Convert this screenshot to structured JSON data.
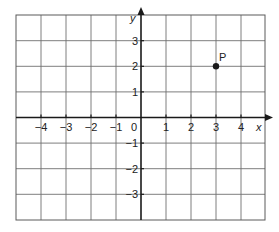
{
  "chart_data": {
    "type": "scatter",
    "title": "",
    "xlabel": "x",
    "ylabel": "y",
    "xlim": [
      -5,
      5
    ],
    "ylim": [
      -4,
      4
    ],
    "grid": true,
    "x_ticks": [
      -4,
      -3,
      -2,
      -1,
      1,
      2,
      3,
      4
    ],
    "y_ticks": [
      -3,
      -2,
      -1,
      1,
      2,
      3
    ],
    "x_tick_labels": [
      "−4",
      "−3",
      "−2",
      "−1",
      "1",
      "2",
      "3",
      "4"
    ],
    "y_tick_labels": [
      "−3",
      "−2",
      "−1",
      "1",
      "2",
      "3"
    ],
    "origin_label": "0",
    "points": [
      {
        "label": "P",
        "x": 3,
        "y": 2
      }
    ],
    "legend": null
  },
  "colors": {
    "grid": "#6f6f6f",
    "axis": "#1a1a1a",
    "point": "#1a1a1a",
    "background": "#ffffff"
  }
}
